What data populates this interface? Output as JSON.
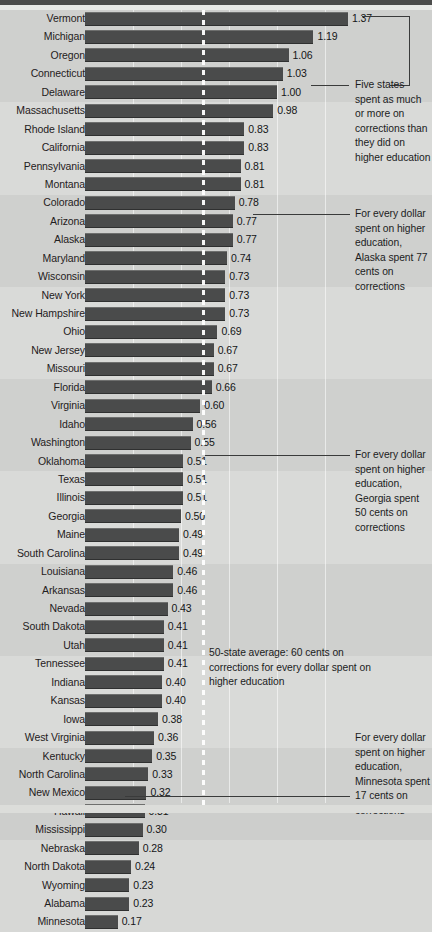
{
  "chart_data": {
    "type": "bar",
    "title": "",
    "subtitle": "",
    "xlabel": "",
    "ylabel": "",
    "orientation": "horizontal",
    "xlim": [
      0,
      1.45
    ],
    "grid": true,
    "gridline_step": 0.25,
    "legend": "none",
    "value_unit": "dollars spent on corrections per dollar spent on higher education",
    "average_line": {
      "value": 0.6,
      "style": "dashed",
      "color": "#ffffff"
    },
    "categories": [
      "Vermont",
      "Michigan",
      "Oregon",
      "Connecticut",
      "Delaware",
      "Massachusetts",
      "Rhode Island",
      "California",
      "Pennsylvania",
      "Montana",
      "Colorado",
      "Arizona",
      "Alaska",
      "Maryland",
      "Wisconsin",
      "New York",
      "New Hampshire",
      "Ohio",
      "New Jersey",
      "Missouri",
      "Florida",
      "Virginia",
      "Idaho",
      "Washington",
      "Oklahoma",
      "Texas",
      "Illinois",
      "Georgia",
      "Maine",
      "South Carolina",
      "Louisiana",
      "Arkansas",
      "Nevada",
      "South Dakota",
      "Utah",
      "Tennessee",
      "Indiana",
      "Kansas",
      "Iowa",
      "West Virginia",
      "Kentucky",
      "North Carolina",
      "New Mexico",
      "Hawaii",
      "Mississippi",
      "Nebraska",
      "North Dakota",
      "Wyoming",
      "Alabama",
      "Minnesota"
    ],
    "values": [
      1.37,
      1.19,
      1.06,
      1.03,
      1.0,
      0.98,
      0.83,
      0.83,
      0.81,
      0.81,
      0.78,
      0.77,
      0.77,
      0.74,
      0.73,
      0.73,
      0.73,
      0.69,
      0.67,
      0.67,
      0.66,
      0.6,
      0.56,
      0.55,
      0.51,
      0.51,
      0.51,
      0.5,
      0.49,
      0.49,
      0.46,
      0.46,
      0.43,
      0.41,
      0.41,
      0.41,
      0.4,
      0.4,
      0.38,
      0.36,
      0.35,
      0.33,
      0.32,
      0.31,
      0.3,
      0.28,
      0.24,
      0.23,
      0.23,
      0.17
    ],
    "value_labels": [
      "1.37",
      "1.19",
      "1.06",
      "1.03",
      "1.00",
      "0.98",
      "0.83",
      "0.83",
      "0.81",
      "0.81",
      "0.78",
      "0.77",
      "0.77",
      "0.74",
      "0.73",
      "0.73",
      "0.73",
      "0.69",
      "0.67",
      "0.67",
      "0.66",
      "0.60",
      "0.56",
      "0.55",
      "0.51",
      "0.51",
      "0.51",
      "0.50",
      "0.49",
      "0.49",
      "0.46",
      "0.46",
      "0.43",
      "0.41",
      "0.41",
      "0.41",
      "0.40",
      "0.40",
      "0.38",
      "0.36",
      "0.35",
      "0.33",
      "0.32",
      "0.31",
      "0.30",
      "0.28",
      "0.24",
      "0.23",
      "0.23",
      "0.17"
    ]
  },
  "annotations": {
    "five_states": "Five states spent as much or more on corrections than they did on higher education",
    "alaska": "For every dollar spent on higher education, Alaska spent 77 cents on corrections",
    "georgia": "For every dollar spent on higher education, Georgia spent 50 cents on corrections",
    "average": "50-state average: 60 cents on corrections for every dollar spent on higher education",
    "minnesota": "For every dollar spent on higher education, Minnesota spent 17 cents on corrections"
  },
  "style": {
    "bar_color": "#4a4b4b",
    "background": "#d9dad8",
    "band_color": "rgba(0,0,0,0.045)",
    "gridline_color": "#ffffff",
    "text_color": "#1f2021"
  }
}
